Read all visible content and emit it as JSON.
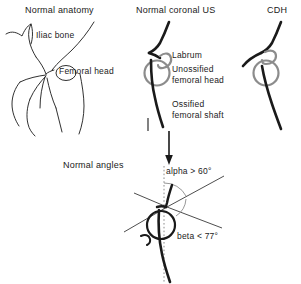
{
  "figure": {
    "kind": "hand-drawn-medical-diagram",
    "background_color": "#ffffff",
    "ink_color": "#1a1a1a",
    "gray_color": "#8c8c8c"
  },
  "panels": {
    "normal_anatomy": {
      "title": "Normal anatomy",
      "labels": {
        "iliac_bone": "Iliac bone",
        "femoral_head": "Femoral head"
      }
    },
    "normal_coronal_us": {
      "title": "Normal coronal US",
      "labels": {
        "labrum": "Labrum",
        "unossified_femoral_head_line1": "Unossified",
        "unossified_femoral_head_line2": "femoral head",
        "ossified_femoral_shaft_line1": "Ossified",
        "ossified_femoral_shaft_line2": "femoral shaft"
      }
    },
    "cdh": {
      "title": "CDH"
    },
    "normal_angles": {
      "title": "Normal angles",
      "labels": {
        "alpha": "alpha > 60°",
        "beta": "beta < 77°"
      }
    }
  },
  "measurements": {
    "alpha": {
      "symbol": "alpha",
      "operator": ">",
      "value": 60,
      "unit": "°"
    },
    "beta": {
      "symbol": "beta",
      "operator": "<",
      "value": 77,
      "unit": "°"
    }
  },
  "connector": {
    "arrow_name": "down-arrow-from-us-to-angles"
  }
}
